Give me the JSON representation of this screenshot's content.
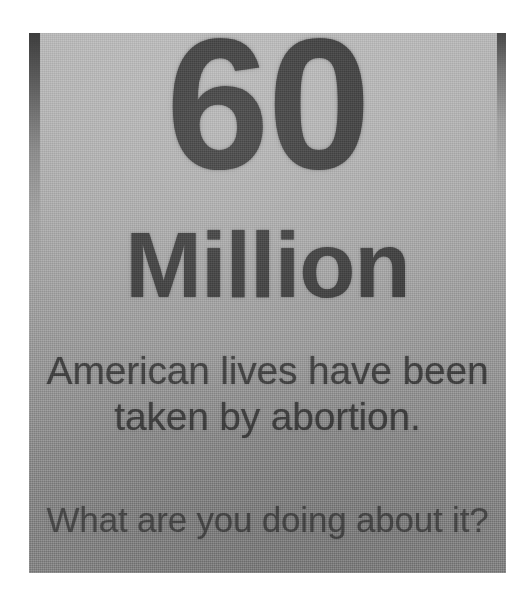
{
  "photo": {
    "subject": "printed-paper-sign",
    "background_color": "#ffffff",
    "paper": {
      "top_color": "#b4b4b4",
      "bottom_color": "#8a8a8a",
      "edge_shadow_color": "#282828"
    },
    "text_color": "#3c3c3c"
  },
  "sign": {
    "headline_number": "60",
    "headline_unit": "Million",
    "body_lines": [
      "American lives have been",
      "taken by abortion."
    ],
    "closing_line": "What are you doing about it?"
  }
}
